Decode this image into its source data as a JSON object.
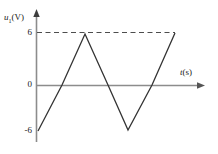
{
  "chart_data": {
    "type": "line",
    "title": "",
    "subtitle": "",
    "xlabel": "t(s)",
    "ylabel": "u₁(V)",
    "ylabel_base": "u",
    "ylabel_sub": "1",
    "ylabel_unit": "(V)",
    "xlabel_base": "t",
    "xlabel_unit": "(s)",
    "grid": false,
    "legend": null,
    "legend_position": "none",
    "ylim": [
      -6,
      6
    ],
    "yticks": [
      "6",
      "0",
      "-6"
    ],
    "ytick_values": [
      6,
      0,
      -6
    ],
    "xticks": [],
    "axis_arrows": [
      "x-right",
      "y-up"
    ],
    "annotations": [
      {
        "name": "dashed-guide-to-peak",
        "style": "dashed",
        "from": [
          0,
          6
        ],
        "to": [
          2,
          6
        ]
      }
    ],
    "series": [
      {
        "name": "u1",
        "waveform": "triangular",
        "x": [
          0,
          1,
          2,
          4,
          5,
          6,
          7
        ],
        "values": [
          -6,
          0,
          6,
          -6,
          0,
          0,
          6
        ],
        "points_px": [
          [
            38,
            131
          ],
          [
            62,
            85
          ],
          [
            85,
            34
          ],
          [
            108,
            85
          ],
          [
            128,
            130
          ],
          [
            152,
            85
          ],
          [
            175,
            33
          ]
        ]
      }
    ]
  },
  "colors": {
    "curve": "#333333",
    "axis": "#8c8c8c",
    "axis_dark": "#555555",
    "dashed": "#4d4d4d",
    "text": "#1a1a1a",
    "background": "#ffffff"
  }
}
